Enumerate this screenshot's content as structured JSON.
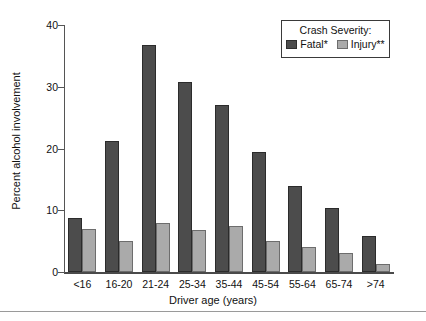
{
  "chart_data": {
    "type": "bar",
    "title": "",
    "xlabel": "Driver age (years)",
    "ylabel": "Percent alcohol involvement",
    "categories": [
      "<16",
      "16-20",
      "21-24",
      "25-34",
      "35-44",
      "45-54",
      "55-64",
      "65-74",
      ">74"
    ],
    "series": [
      {
        "name": "Fatal*",
        "color": "#4c4c4c",
        "values": [
          8.8,
          21.2,
          36.8,
          30.8,
          27.0,
          19.5,
          14.0,
          10.3,
          5.8
        ]
      },
      {
        "name": "Injury**",
        "color": "#aaaaaa",
        "values": [
          7.0,
          5.0,
          8.0,
          6.8,
          7.5,
          5.1,
          4.0,
          3.0,
          1.3
        ]
      }
    ],
    "ylim": [
      0,
      40
    ],
    "yticks": [
      0,
      10,
      20,
      30,
      40
    ],
    "ytick_labels": [
      "0",
      "10",
      "20",
      "30",
      "40"
    ],
    "grid": false,
    "legend_position": "top-right",
    "legend_title": "Crash Severity:"
  },
  "legend": {
    "title": "Crash Severity:",
    "items": [
      {
        "label": "Fatal*",
        "color": "#4c4c4c"
      },
      {
        "label": "Injury**",
        "color": "#aaaaaa"
      }
    ]
  },
  "axes": {
    "x_title": "Driver age (years)",
    "y_title": "Percent alcohol involvement"
  }
}
